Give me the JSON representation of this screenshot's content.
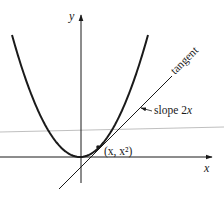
{
  "figure": {
    "axes": {
      "x_label": "x",
      "y_label": "y"
    },
    "curve": {
      "name": "parabola",
      "equation": "y = x^2"
    },
    "point": {
      "label": "(x, x²)"
    },
    "tangent": {
      "label": "tangent",
      "slope_label": "slope 2x",
      "slope_prefix": "slope 2",
      "slope_var": "x"
    },
    "colors": {
      "ink": "#1a1a1a",
      "guide_line": "#b0b0b0",
      "background": "#ffffff"
    }
  }
}
